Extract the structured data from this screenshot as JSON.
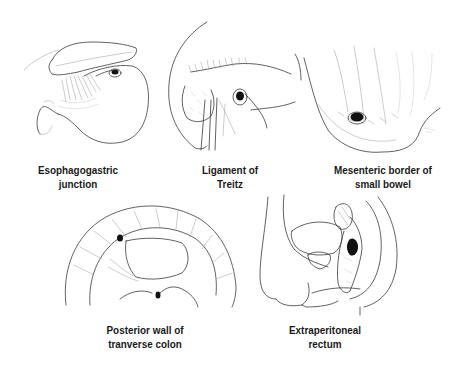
{
  "figure": {
    "panels": [
      {
        "id": "esophagogastric",
        "label_lines": [
          "Esophagogastric",
          "junction"
        ],
        "illustration": "stomach-with-defect-at-esophagogastric-junction"
      },
      {
        "id": "treitz",
        "label_lines": [
          "Ligament of",
          "Treitz"
        ],
        "illustration": "duodenojejunal-flexure-with-defect"
      },
      {
        "id": "mesenteric",
        "label_lines": [
          "Mesenteric border of",
          "small bowel"
        ],
        "illustration": "small-bowel-loop-with-mesenteric-defect"
      },
      {
        "id": "transverse-colon",
        "label_lines": [
          "Posterior wall of",
          "tranverse colon"
        ],
        "illustration": "transverse-colon-posterior-view-with-defect"
      },
      {
        "id": "rectum",
        "label_lines": [
          "Extraperitoneal",
          "rectum"
        ],
        "illustration": "pelvic-sagittal-section-rectum-with-defect"
      }
    ],
    "colors": {
      "line": "#3a3a3a",
      "defect": "#111111",
      "background": "#ffffff",
      "label": "#1a1a1a"
    }
  }
}
